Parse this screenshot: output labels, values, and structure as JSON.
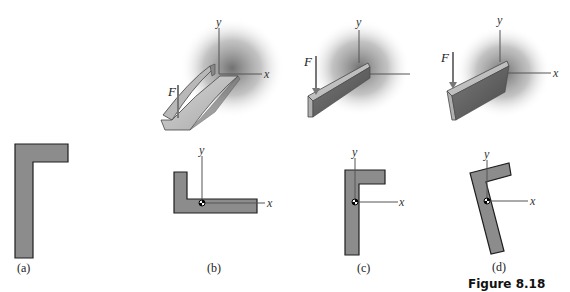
{
  "figure": {
    "caption": "Figure 8.18",
    "panels": [
      {
        "id": "a",
        "label": "(a)"
      },
      {
        "id": "b",
        "label": "(b)",
        "force_label": "F",
        "axis_x": "x",
        "axis_y": "y",
        "view_label_x": "x",
        "view_label_y": "y"
      },
      {
        "id": "c",
        "label": "(c)",
        "force_label": "F",
        "axis_x": "x",
        "axis_y": "y",
        "view_label_x": "x",
        "view_label_y": "y"
      },
      {
        "id": "d",
        "label": "(d)",
        "force_label": "F",
        "axis_x": "x",
        "axis_y": "y",
        "view_label_x": "x",
        "view_label_y": "y"
      }
    ]
  },
  "colors": {
    "section_fill": "#8c8c8c",
    "outline": "#1e1e1e",
    "shadow": "#6e6e6e",
    "beam_light": "#c8c8c8",
    "beam_dark": "#5a5a5a"
  }
}
